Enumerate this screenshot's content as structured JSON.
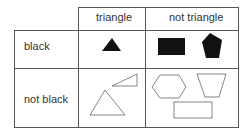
{
  "table": {
    "column_headers": [
      "triangle",
      "not triangle"
    ],
    "row_headers": [
      "black",
      "not black"
    ],
    "cells": {
      "black_triangle": [
        "filled triangle"
      ],
      "black_not_triangle": [
        "filled rectangle",
        "filled pentagon"
      ],
      "not_black_triangle": [
        "outline right triangle (slanted)",
        "outline triangle"
      ],
      "not_black_not_triangle": [
        "outline hexagon",
        "outline trapezoid",
        "outline rectangle"
      ]
    }
  },
  "colors": {
    "fill": "#111111",
    "stroke": "#555555",
    "background": "#ffffff"
  }
}
